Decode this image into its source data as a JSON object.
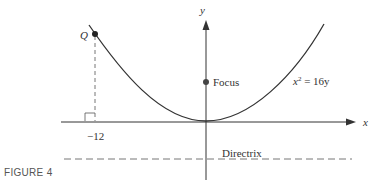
{
  "figure": {
    "caption": "FIGURE 4",
    "equation_base": "x",
    "equation_exp": "2",
    "equation_rest": " = 16y",
    "focus_label": "Focus",
    "directrix_label": "Directrix",
    "point_label": "Q",
    "tick_label": "−12",
    "x_axis_label": "x",
    "y_axis_label": "y",
    "colors": {
      "curve": "#333333",
      "axis": "#333333",
      "dashed": "#777777"
    }
  }
}
